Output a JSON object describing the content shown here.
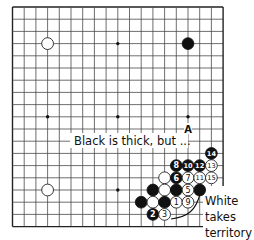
{
  "board": {
    "size": 19,
    "origin_x": 12.5,
    "origin_y": 7,
    "spacing_x": 11.7,
    "spacing_y": 12.2,
    "stone_radius": 5.9,
    "star_points": [
      [
        3,
        3
      ],
      [
        9,
        3
      ],
      [
        15,
        3
      ],
      [
        3,
        9
      ],
      [
        9,
        9
      ],
      [
        15,
        9
      ],
      [
        3,
        15
      ],
      [
        9,
        15
      ],
      [
        15,
        15
      ]
    ],
    "colors": {
      "black": "#111111",
      "white": "#ffffff",
      "line": "#4a4a4a"
    }
  },
  "stones": [
    {
      "color": "white",
      "col": 3,
      "row": 3,
      "number": ""
    },
    {
      "color": "black",
      "col": 15,
      "row": 3,
      "number": ""
    },
    {
      "color": "white",
      "col": 3,
      "row": 15,
      "number": ""
    },
    {
      "color": "white",
      "col": 13,
      "row": 14,
      "number": ""
    },
    {
      "color": "black",
      "col": 12,
      "row": 15,
      "number": ""
    },
    {
      "color": "white",
      "col": 13,
      "row": 15,
      "number": ""
    },
    {
      "color": "black",
      "col": 14,
      "row": 15,
      "number": ""
    },
    {
      "color": "black",
      "col": 16,
      "row": 15,
      "number": ""
    },
    {
      "color": "black",
      "col": 11,
      "row": 16,
      "number": ""
    },
    {
      "color": "white",
      "col": 12,
      "row": 16,
      "number": ""
    },
    {
      "color": "black",
      "col": 13,
      "row": 16,
      "number": ""
    },
    {
      "color": "white",
      "col": 14,
      "row": 16,
      "number": "1"
    },
    {
      "color": "black",
      "col": 12,
      "row": 17,
      "number": "2"
    },
    {
      "color": "white",
      "col": 13,
      "row": 17,
      "number": "3"
    },
    {
      "color": "white",
      "col": 15,
      "row": 15,
      "number": "5"
    },
    {
      "color": "black",
      "col": 14,
      "row": 14,
      "number": "6"
    },
    {
      "color": "white",
      "col": 15,
      "row": 14,
      "number": "7"
    },
    {
      "color": "black",
      "col": 14,
      "row": 13,
      "number": "8"
    },
    {
      "color": "white",
      "col": 15,
      "row": 16,
      "number": "9"
    },
    {
      "color": "black",
      "col": 15,
      "row": 13,
      "number": "10"
    },
    {
      "color": "white",
      "col": 16,
      "row": 14,
      "number": "11"
    },
    {
      "color": "black",
      "col": 16,
      "row": 13,
      "number": "12"
    },
    {
      "color": "white",
      "col": 17,
      "row": 13,
      "number": "13"
    },
    {
      "color": "black",
      "col": 17,
      "row": 12,
      "number": "14"
    },
    {
      "color": "white",
      "col": 17,
      "row": 14,
      "number": "15"
    }
  ],
  "markers": [
    {
      "label": "A",
      "col": 15,
      "row": 10
    }
  ],
  "annotations": {
    "black_thick": "Black is thick, but ...",
    "white_territory_lines": [
      "White",
      "takes",
      "territory"
    ]
  }
}
